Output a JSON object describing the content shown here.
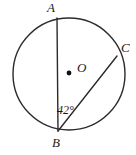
{
  "figure": {
    "kind": "circle-geometry-diagram",
    "background_color": "#ffffff",
    "stroke_color": "#2b2b2b",
    "label_color": "#1a1a1a",
    "canvas": {
      "width": 136,
      "height": 155
    }
  },
  "circle": {
    "name": "circle-O",
    "center": {
      "x": 69,
      "y": 74
    },
    "radius": 56,
    "stroke_width": 1.4
  },
  "center_point": {
    "label": "O",
    "dot": {
      "x": 69,
      "y": 73
    },
    "dot_radius": 2.4
  },
  "points": [
    {
      "id": "A",
      "label": "A",
      "x": 57,
      "y": 18
    },
    {
      "id": "B",
      "label": "B",
      "x": 58,
      "y": 131
    },
    {
      "id": "C",
      "label": "C",
      "x": 117,
      "y": 56
    }
  ],
  "chords": [
    {
      "id": "AB",
      "from": "A",
      "to": "B",
      "x1": 57,
      "y1": 18,
      "x2": 58,
      "y2": 131
    },
    {
      "id": "BC",
      "from": "B",
      "to": "C",
      "x1": 58,
      "y1": 131,
      "x2": 117,
      "y2": 56
    }
  ],
  "angles": [
    {
      "id": "ABC",
      "vertex": "B",
      "label": "42°",
      "value": 42,
      "unit": "degrees"
    }
  ]
}
